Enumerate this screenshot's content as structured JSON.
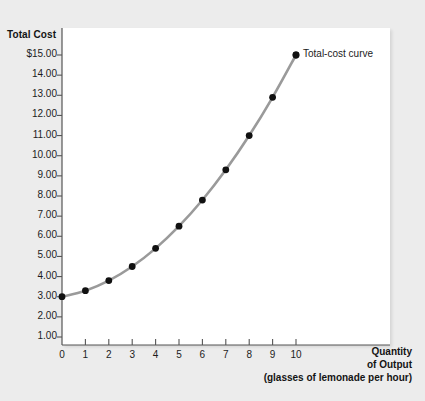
{
  "chart_data": {
    "type": "line",
    "title": "",
    "subtitle": "",
    "xlabel": "Quantity of Output",
    "xlabel_lines": [
      "Quantity",
      "of Output",
      "(glasses of lemonade per hour)"
    ],
    "ylabel": "Total Cost",
    "x": [
      0,
      1,
      2,
      3,
      4,
      5,
      6,
      7,
      8,
      9,
      10
    ],
    "values": [
      3.0,
      3.3,
      3.8,
      4.5,
      5.4,
      6.5,
      7.8,
      9.3,
      11.0,
      12.9,
      15.0
    ],
    "series": [
      {
        "name": "Total-cost curve",
        "values": [
          3.0,
          3.3,
          3.8,
          4.5,
          5.4,
          6.5,
          7.8,
          9.3,
          11.0,
          12.9,
          15.0
        ]
      }
    ],
    "xtick_labels": [
      "0",
      "1",
      "2",
      "3",
      "4",
      "5",
      "6",
      "7",
      "8",
      "9",
      "10"
    ],
    "ytick_labels": [
      "$15.00",
      "14.00",
      "13.00",
      "12.00",
      "11.00",
      "10.00",
      "9.00",
      "8.00",
      "7.00",
      "6.00",
      "5.00",
      "4.00",
      "3.00",
      "2.00",
      "1.00"
    ],
    "ytick_values": [
      15,
      14,
      13,
      12,
      11,
      10,
      9,
      8,
      7,
      6,
      5,
      4,
      3,
      2,
      1
    ],
    "xlim": [
      0,
      14
    ],
    "ylim": [
      0,
      15.6
    ],
    "grid": false,
    "legend_position": "inline-annotation",
    "annotations": [
      {
        "text": "Total-cost curve",
        "x": 10,
        "y": 15.0
      }
    ],
    "colors": {
      "curve": "#9a9a9a",
      "marker": "#111111",
      "axis": "#555555",
      "text": "#1c1c1c",
      "page_background": "#ececec",
      "plot_background": "#ffffff"
    }
  }
}
